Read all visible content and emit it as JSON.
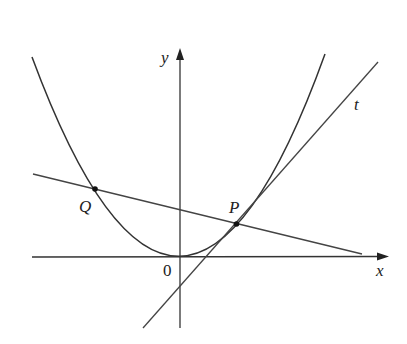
{
  "diagram": {
    "labels": {
      "y_axis": "y",
      "x_axis": "x",
      "origin": "0",
      "point_p": "P",
      "point_q": "Q",
      "tangent": "t"
    },
    "colors": {
      "stroke": "#333333",
      "background": "#ffffff"
    },
    "elements": [
      {
        "type": "axis",
        "name": "x-axis",
        "direction": "horizontal"
      },
      {
        "type": "axis",
        "name": "y-axis",
        "direction": "vertical"
      },
      {
        "type": "curve",
        "name": "parabola",
        "shape": "upward parabola, vertex at origin"
      },
      {
        "type": "line",
        "name": "tangent-line-t",
        "through": "P"
      },
      {
        "type": "line",
        "name": "secant-line",
        "through": [
          "Q",
          "P"
        ]
      },
      {
        "type": "point",
        "name": "P"
      },
      {
        "type": "point",
        "name": "Q"
      }
    ]
  }
}
